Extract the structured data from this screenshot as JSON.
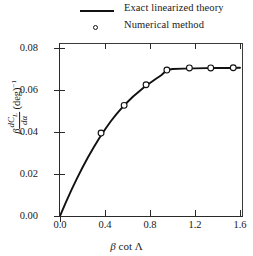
{
  "legend": {
    "entries": [
      {
        "label": "Exact linearized theory",
        "marker": "line",
        "color": "#111111"
      },
      {
        "label": "Numerical method",
        "marker": "open-circle",
        "color": "#111111"
      }
    ]
  },
  "axes": {
    "x_ticks": [
      "0.0",
      "0.4",
      "0.8",
      "1.2",
      "1.6"
    ],
    "y_ticks": [
      "0.00",
      "0.02",
      "0.04",
      "0.06",
      "0.08"
    ],
    "x_title_parts": {
      "beta": "β",
      "cot": "cot",
      "lambda": "Λ"
    },
    "y_title_parts": {
      "beta": "β",
      "numerator": "dC",
      "numerator_sub": "L",
      "denominator": "dα",
      "unit": "(deg)",
      "exponent": "−1"
    }
  },
  "chart_data": {
    "type": "line",
    "title": "",
    "xlabel": "β cot Λ",
    "ylabel": "β dC_L/dα (deg)^-1",
    "xlim": [
      0.0,
      1.62
    ],
    "ylim": [
      0.0,
      0.084
    ],
    "grid": false,
    "legend_position": "top-center-outside",
    "series": [
      {
        "name": "Exact linearized theory",
        "type": "line",
        "style": "solid",
        "color": "#111111",
        "x": [
          0.0,
          0.05,
          0.1,
          0.15,
          0.2,
          0.25,
          0.3,
          0.35,
          0.4,
          0.45,
          0.5,
          0.55,
          0.6,
          0.65,
          0.7,
          0.75,
          0.8,
          0.85,
          0.9,
          0.95,
          1.0,
          1.1,
          1.2,
          1.3,
          1.4,
          1.5,
          1.6
        ],
        "y": [
          0.0,
          0.0062,
          0.0122,
          0.0178,
          0.0231,
          0.0281,
          0.0327,
          0.0371,
          0.0412,
          0.045,
          0.0484,
          0.0515,
          0.0543,
          0.0569,
          0.0592,
          0.0614,
          0.0633,
          0.0652,
          0.067,
          0.0695,
          0.07,
          0.0702,
          0.0703,
          0.0704,
          0.0705,
          0.0705,
          0.0706
        ]
      },
      {
        "name": "Numerical method",
        "type": "scatter",
        "marker": "open-circle",
        "color": "#111111",
        "x": [
          0.365,
          0.57,
          0.765,
          0.95,
          1.15,
          1.34,
          1.54
        ],
        "y": [
          0.0395,
          0.0527,
          0.0625,
          0.0695,
          0.0705,
          0.0705,
          0.0706
        ]
      }
    ]
  }
}
